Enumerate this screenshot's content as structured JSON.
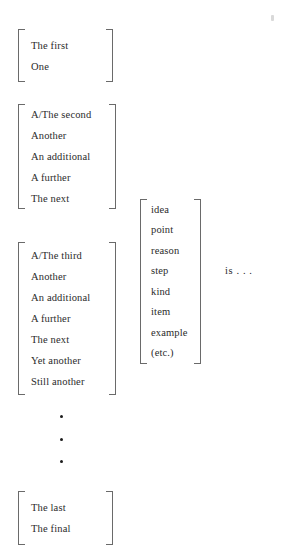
{
  "figure": {
    "background_color": "#ffffff",
    "text_color": "#2b2b2b",
    "bracket_color": "#6a6a6a",
    "dot_color": "#1c1c1c",
    "predicate": "is . . ."
  },
  "left_column": {
    "groups": [
      {
        "name": "first",
        "items": [
          "The first",
          "One"
        ]
      },
      {
        "name": "second",
        "items": [
          "A/The second",
          "Another",
          "An additional",
          "A further",
          "The next"
        ]
      },
      {
        "name": "third",
        "items": [
          "A/The third",
          "Another",
          "An additional",
          "A further",
          "The next",
          "Yet another",
          "Still another"
        ]
      },
      {
        "name": "last",
        "items": [
          "The last",
          "The final"
        ]
      }
    ],
    "ellipsis_dots": [
      "•",
      "•",
      "•"
    ]
  },
  "middle_column": {
    "group": {
      "name": "nouns",
      "items": [
        "idea",
        "point",
        "reason",
        "step",
        "kind",
        "item",
        "example",
        "(etc.)"
      ]
    }
  }
}
